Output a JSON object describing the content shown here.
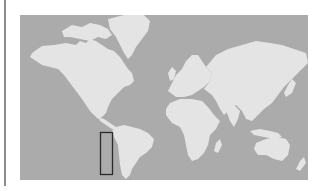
{
  "map": {
    "type": "world-locator",
    "projection": "mercator",
    "colors": {
      "ocean": "#ababab",
      "land": "#e4e4e4",
      "highlight_stroke": "#2a2a2a",
      "page_background": "#ffffff",
      "left_rule": "#8c8c8c"
    },
    "highlight": {
      "region": "Chile",
      "shape": "rectangle"
    },
    "continents": [
      "North America",
      "South America",
      "Greenland",
      "Europe",
      "Asia",
      "Africa",
      "Australia"
    ]
  }
}
